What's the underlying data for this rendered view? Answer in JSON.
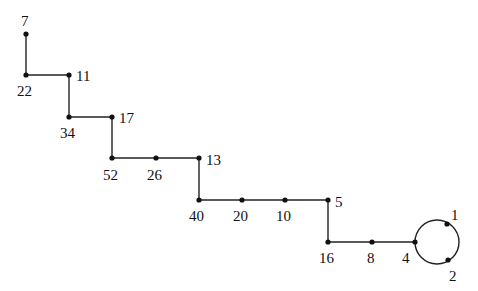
{
  "diagram": {
    "type": "functional-graph",
    "nodes": [
      {
        "id": "7",
        "label": "7",
        "x": 26,
        "y": 34,
        "lx": 21,
        "ly": 26
      },
      {
        "id": "22",
        "label": "22",
        "x": 26,
        "y": 75,
        "lx": 17,
        "ly": 96
      },
      {
        "id": "11",
        "label": "11",
        "x": 69,
        "y": 75,
        "lx": 76,
        "ly": 81
      },
      {
        "id": "34",
        "label": "34",
        "x": 69,
        "y": 117,
        "lx": 60,
        "ly": 138
      },
      {
        "id": "17",
        "label": "17",
        "x": 112,
        "y": 117,
        "lx": 119,
        "ly": 123
      },
      {
        "id": "52",
        "label": "52",
        "x": 112,
        "y": 158,
        "lx": 103,
        "ly": 180
      },
      {
        "id": "26",
        "label": "26",
        "x": 156,
        "y": 158,
        "lx": 147,
        "ly": 180
      },
      {
        "id": "13",
        "label": "13",
        "x": 199,
        "y": 158,
        "lx": 206,
        "ly": 165
      },
      {
        "id": "40",
        "label": "40",
        "x": 199,
        "y": 200,
        "lx": 189,
        "ly": 221
      },
      {
        "id": "20",
        "label": "20",
        "x": 242,
        "y": 200,
        "lx": 233,
        "ly": 221
      },
      {
        "id": "10",
        "label": "10",
        "x": 285,
        "y": 200,
        "lx": 276,
        "ly": 221
      },
      {
        "id": "5",
        "label": "5",
        "x": 328,
        "y": 200,
        "lx": 335,
        "ly": 207
      },
      {
        "id": "16",
        "label": "16",
        "x": 328,
        "y": 242,
        "lx": 319,
        "ly": 263
      },
      {
        "id": "8",
        "label": "8",
        "x": 372,
        "y": 242,
        "lx": 367,
        "ly": 263
      },
      {
        "id": "4",
        "label": "4",
        "x": 415,
        "y": 242,
        "lx": 402,
        "ly": 263
      },
      {
        "id": "1",
        "label": "1",
        "x": 447,
        "y": 224,
        "lx": 451,
        "ly": 220
      },
      {
        "id": "2",
        "label": "2",
        "x": 448,
        "y": 260,
        "lx": 449,
        "ly": 281
      }
    ],
    "edges": [
      [
        "7",
        "22"
      ],
      [
        "22",
        "11"
      ],
      [
        "11",
        "34"
      ],
      [
        "34",
        "17"
      ],
      [
        "17",
        "52"
      ],
      [
        "52",
        "26"
      ],
      [
        "26",
        "13"
      ],
      [
        "13",
        "40"
      ],
      [
        "40",
        "20"
      ],
      [
        "20",
        "10"
      ],
      [
        "10",
        "5"
      ],
      [
        "5",
        "16"
      ],
      [
        "16",
        "8"
      ],
      [
        "8",
        "4"
      ]
    ],
    "cycle": {
      "nodes": [
        "4",
        "1",
        "2"
      ],
      "cx": 437,
      "cy": 242,
      "r": 22
    }
  }
}
